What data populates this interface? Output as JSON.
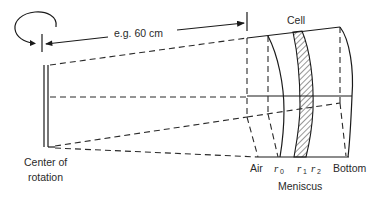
{
  "diagram": {
    "type": "ultracentrifuge cell schematic",
    "labels": {
      "distance": "e.g. 60 cm",
      "cell": "Cell",
      "center_line1": "Center of",
      "center_line2": "rotation",
      "air": "Air",
      "r0_base": "r",
      "r0_sub": "0",
      "r1_base": "r",
      "r1_sub": "1",
      "r2_base": "r",
      "r2_sub": "2",
      "bottom": "Bottom",
      "meniscus": "Meniscus"
    },
    "icons": {
      "rotation": "rotation-arrow-icon"
    },
    "colors": {
      "ink": "#1a1a1a",
      "background": "#ffffff"
    }
  }
}
